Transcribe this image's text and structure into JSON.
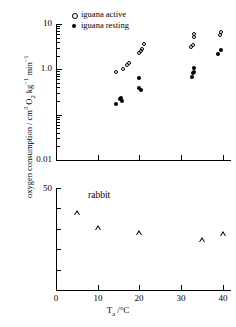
{
  "figure": {
    "xlabel_html": "T<sub>a</sub> /°C",
    "ylabel_html": "oxygen consumption / cm<sup>3</sup> O<sub>2</sub> kg<sup>−1</sup> min<sup>−1</sup>",
    "ylabel_plain": "oxygen consumption / cm3 O2 kg-1 min-1"
  },
  "legend": {
    "position": "top-right-inside",
    "entries": [
      {
        "label": "iguana active",
        "marker": "open-circle-marker"
      },
      {
        "label": "iguana resting",
        "marker": "filled-circle-marker"
      }
    ]
  },
  "panel_label": "rabbit",
  "chart_data": [
    {
      "type": "scatter",
      "title": "",
      "xlabel": "Ta /°C",
      "ylabel": "oxygen consumption / cm3 O2 kg-1 min-1",
      "yscale": "log",
      "xlim": [
        0,
        42
      ],
      "ylim": [
        0.01,
        10
      ],
      "ytick_labels": [
        "10",
        "1.0",
        "0.01"
      ],
      "ytick_values": [
        10,
        1.0,
        0.01
      ],
      "xtick_values": [
        0,
        10,
        20,
        30,
        40
      ],
      "grid": false,
      "series": [
        {
          "name": "iguana active",
          "marker": "open circle",
          "points": [
            {
              "x": 14.5,
              "y": 0.88
            },
            {
              "x": 16.0,
              "y": 1.0
            },
            {
              "x": 17.0,
              "y": 1.25
            },
            {
              "x": 17.5,
              "y": 1.4
            },
            {
              "x": 20.0,
              "y": 2.3
            },
            {
              "x": 20.3,
              "y": 2.6
            },
            {
              "x": 20.6,
              "y": 2.75
            },
            {
              "x": 21.0,
              "y": 3.6
            },
            {
              "x": 32.5,
              "y": 3.1
            },
            {
              "x": 32.8,
              "y": 3.4
            },
            {
              "x": 33.0,
              "y": 5.1
            },
            {
              "x": 33.2,
              "y": 6.0
            },
            {
              "x": 39.3,
              "y": 5.8
            },
            {
              "x": 39.6,
              "y": 6.6
            }
          ]
        },
        {
          "name": "iguana resting",
          "marker": "filled circle",
          "points": [
            {
              "x": 14.3,
              "y": 0.175
            },
            {
              "x": 15.3,
              "y": 0.225
            },
            {
              "x": 15.6,
              "y": 0.235
            },
            {
              "x": 15.8,
              "y": 0.205
            },
            {
              "x": 19.8,
              "y": 0.39
            },
            {
              "x": 20.4,
              "y": 0.345
            },
            {
              "x": 20.0,
              "y": 0.64
            },
            {
              "x": 32.6,
              "y": 0.68
            },
            {
              "x": 32.8,
              "y": 0.84
            },
            {
              "x": 33.0,
              "y": 0.89
            },
            {
              "x": 33.1,
              "y": 1.05
            },
            {
              "x": 38.8,
              "y": 2.15
            },
            {
              "x": 39.6,
              "y": 2.7
            }
          ]
        }
      ]
    },
    {
      "type": "scatter",
      "title": "rabbit",
      "xlabel": "Ta /°C",
      "ylabel": "oxygen consumption / cm3 O2 kg-1 min-1",
      "yscale": "linear",
      "xlim": [
        0,
        42
      ],
      "ylim": [
        0,
        50
      ],
      "ytick_labels": [
        "50"
      ],
      "ytick_values": [
        50,
        40,
        30,
        20,
        10,
        0
      ],
      "xtick_values": [
        0,
        10,
        20,
        30,
        40
      ],
      "grid": false,
      "series": [
        {
          "name": "rabbit",
          "marker": "open triangle",
          "points": [
            {
              "x": 5.0,
              "y": 38.0
            },
            {
              "x": 10.0,
              "y": 30.5
            },
            {
              "x": 20.0,
              "y": 28.0
            },
            {
              "x": 35.0,
              "y": 24.5
            },
            {
              "x": 40.0,
              "y": 27.5
            }
          ]
        }
      ]
    }
  ]
}
